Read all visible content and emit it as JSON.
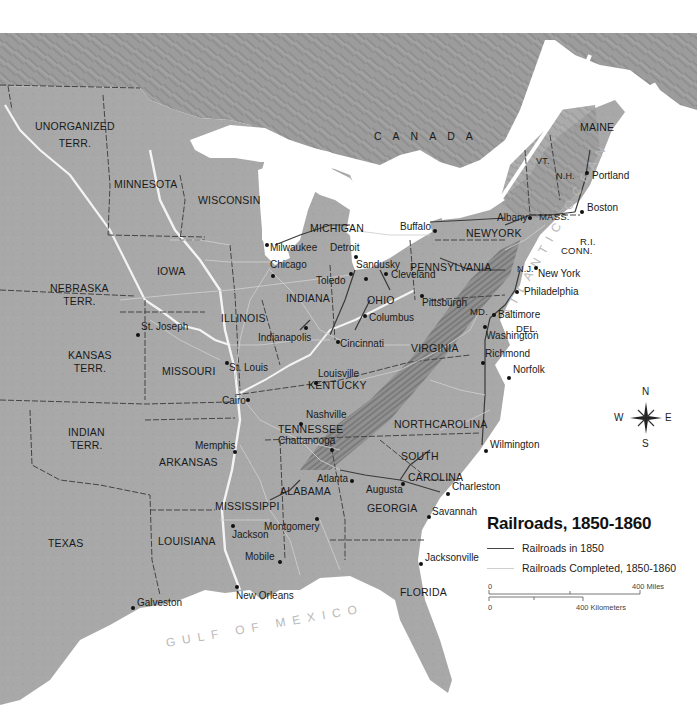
{
  "map": {
    "title": "Railroads, 1850-1860",
    "legend": {
      "items": [
        {
          "label": "Railroads in 1850",
          "color": "#444444"
        },
        {
          "label": "Railroads Completed, 1850-1860",
          "color": "#cfcfcf"
        }
      ]
    },
    "scale": {
      "miles_zero": "0",
      "miles_label": "400 Miles",
      "km_zero": "0",
      "km_label": "400 Kilometers"
    },
    "compass": {
      "n": "N",
      "s": "S",
      "e": "E",
      "w": "W"
    },
    "regions": {
      "canada": "CANADA",
      "atlantic": "ATLANTIC OCEAN",
      "gulf": "GULF OF MEXICO"
    },
    "states": [
      {
        "id": "unorganized",
        "line1": "UNORGANIZED",
        "line2": "TERR."
      },
      {
        "id": "minnesota",
        "line1": "MINNESOTA"
      },
      {
        "id": "wisconsin",
        "line1": "WISCONSIN"
      },
      {
        "id": "michigan",
        "line1": "MICHIGAN"
      },
      {
        "id": "iowa",
        "line1": "IOWA"
      },
      {
        "id": "nebraska",
        "line1": "NEBRASKA",
        "line2": "TERR."
      },
      {
        "id": "kansas",
        "line1": "KANSAS",
        "line2": "TERR."
      },
      {
        "id": "illinois",
        "line1": "ILLINOIS"
      },
      {
        "id": "indiana",
        "line1": "INDIANA"
      },
      {
        "id": "ohio",
        "line1": "OHIO"
      },
      {
        "id": "missouri",
        "line1": "MISSOURI"
      },
      {
        "id": "kentucky",
        "line1": "KENTUCKY"
      },
      {
        "id": "indian",
        "line1": "INDIAN",
        "line2": "TERR."
      },
      {
        "id": "arkansas",
        "line1": "ARKANSAS"
      },
      {
        "id": "tennessee",
        "line1": "TENNESSEE"
      },
      {
        "id": "texas",
        "line1": "TEXAS"
      },
      {
        "id": "louisiana",
        "line1": "LOUISIANA"
      },
      {
        "id": "mississippi",
        "line1": "MISSISSIPPI"
      },
      {
        "id": "alabama",
        "line1": "ALABAMA"
      },
      {
        "id": "georgia",
        "line1": "GEORGIA"
      },
      {
        "id": "florida",
        "line1": "FLORIDA"
      },
      {
        "id": "south-carolina",
        "line1": "SOUTH",
        "line2": "CAROLINA"
      },
      {
        "id": "north-carolina",
        "line1": "NORTHCAROLINA"
      },
      {
        "id": "virginia",
        "line1": "VIRGINIA"
      },
      {
        "id": "pennsylvania",
        "line1": "PENNSYLVANIA"
      },
      {
        "id": "new-york",
        "line1": "NEWYORK"
      },
      {
        "id": "maine",
        "line1": "MAINE"
      },
      {
        "id": "vermont",
        "line1": "VT."
      },
      {
        "id": "new-hampshire",
        "line1": "N.H."
      },
      {
        "id": "massachusetts",
        "line1": "MASS."
      },
      {
        "id": "rhode-island",
        "line1": "R.I."
      },
      {
        "id": "connecticut",
        "line1": "CONN."
      },
      {
        "id": "new-jersey",
        "line1": "N.J."
      },
      {
        "id": "maryland",
        "line1": "MD."
      },
      {
        "id": "delaware",
        "line1": "DEL."
      }
    ],
    "cities": [
      {
        "name": "Portland"
      },
      {
        "name": "Boston"
      },
      {
        "name": "Albany"
      },
      {
        "name": "Buffalo"
      },
      {
        "name": "New York"
      },
      {
        "name": "Philadelphia"
      },
      {
        "name": "Pittsburgh"
      },
      {
        "name": "Baltimore"
      },
      {
        "name": "Washington"
      },
      {
        "name": "Richmond"
      },
      {
        "name": "Norfolk"
      },
      {
        "name": "Wilmington"
      },
      {
        "name": "Charleston"
      },
      {
        "name": "Savannah"
      },
      {
        "name": "Augusta"
      },
      {
        "name": "Atlanta"
      },
      {
        "name": "Chattanooga"
      },
      {
        "name": "Nashville"
      },
      {
        "name": "Louisville"
      },
      {
        "name": "Cincinnati"
      },
      {
        "name": "Columbus"
      },
      {
        "name": "Cleveland"
      },
      {
        "name": "Sandusky"
      },
      {
        "name": "Toledo"
      },
      {
        "name": "Detroit"
      },
      {
        "name": "Milwaukee"
      },
      {
        "name": "Chicago"
      },
      {
        "name": "Indianapolis"
      },
      {
        "name": "St. Louis"
      },
      {
        "name": "St. Joseph"
      },
      {
        "name": "Cairo"
      },
      {
        "name": "Memphis"
      },
      {
        "name": "Jackson"
      },
      {
        "name": "Montgomery"
      },
      {
        "name": "Mobile"
      },
      {
        "name": "New Orleans"
      },
      {
        "name": "Galveston"
      },
      {
        "name": "Jacksonville"
      }
    ]
  }
}
